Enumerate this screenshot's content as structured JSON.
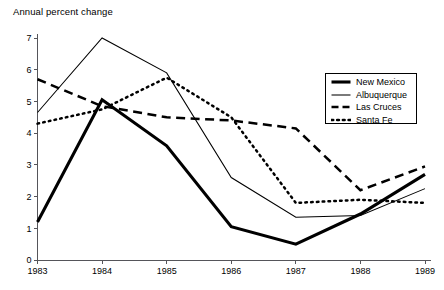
{
  "chart_data": {
    "type": "line",
    "title": "Annual percent change",
    "xlabel": "",
    "ylabel": "",
    "categories": [
      "1983",
      "1984",
      "1985",
      "1986",
      "1987",
      "1988",
      "1989"
    ],
    "x": [
      1983,
      1984,
      1985,
      1986,
      1987,
      1988,
      1989
    ],
    "ylim": [
      0,
      7
    ],
    "xlim": [
      1983,
      1989
    ],
    "grid": false,
    "legend_position": "right",
    "y_ticks": [
      "0",
      "1",
      "2",
      "3",
      "4",
      "5",
      "6",
      "7"
    ],
    "y_tick_values": [
      0,
      1,
      2,
      3,
      4,
      5,
      6,
      7
    ],
    "series": [
      {
        "name": "New Mexico",
        "style": "thick-solid",
        "values": [
          1.2,
          5.05,
          3.6,
          1.05,
          0.5,
          1.45,
          2.7
        ]
      },
      {
        "name": "Albuquerque",
        "style": "thin-solid",
        "values": [
          4.65,
          7.0,
          5.9,
          2.6,
          1.35,
          1.4,
          2.25
        ]
      },
      {
        "name": "Las Cruces",
        "style": "dashed",
        "values": [
          5.7,
          4.85,
          4.5,
          4.4,
          4.15,
          2.2,
          2.95
        ]
      },
      {
        "name": "Santa Fe",
        "style": "dotted",
        "values": [
          4.3,
          4.75,
          5.75,
          4.5,
          1.8,
          1.9,
          1.8
        ]
      }
    ]
  },
  "legend": {
    "items": [
      {
        "label": "New Mexico"
      },
      {
        "label": "Albuquerque"
      },
      {
        "label": "Las Cruces"
      },
      {
        "label": "Santa Fe"
      }
    ]
  },
  "colors": {
    "ink": "#000000",
    "axis": "#55555a",
    "background": "#ffffff"
  }
}
